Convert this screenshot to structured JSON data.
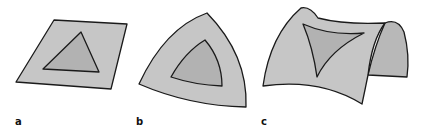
{
  "figure": {
    "panels": [
      {
        "label": "a",
        "surface": "flat plane",
        "shape": "triangle on plane"
      },
      {
        "label": "b",
        "surface": "sphere",
        "shape": "spherical triangle"
      },
      {
        "label": "c",
        "surface": "saddle (hyperbolic)",
        "shape": "hyperbolic triangle"
      }
    ],
    "colors": {
      "surface_fill": "#c6c6c6",
      "triangle_fill": "#b2b2b2",
      "back_fill": "#b8b8b8",
      "stroke": "#1a1a1a"
    }
  }
}
